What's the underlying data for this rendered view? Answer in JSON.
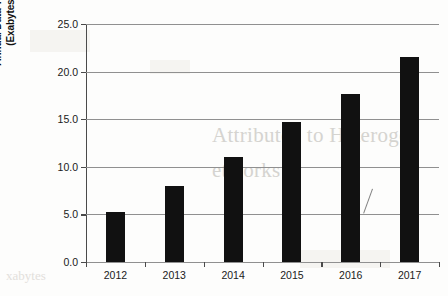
{
  "chart_data": {
    "type": "bar",
    "title": "",
    "subtitle": "",
    "xlabel": "",
    "ylabel": "Annual Data Traffic (Exabytes)",
    "ylabel_lines": [
      "Annual Data Traffic",
      "(Exabytes)"
    ],
    "categories": [
      "2012",
      "2013",
      "2014",
      "2015",
      "2016",
      "2017"
    ],
    "values": [
      5.3,
      8.0,
      11.0,
      14.7,
      17.7,
      21.5
    ],
    "ylim": [
      0.0,
      25.0
    ],
    "ytick_values": [
      0.0,
      5.0,
      10.0,
      15.0,
      20.0,
      25.0
    ],
    "ytick_labels": [
      "0.0",
      "5.0",
      "10.0",
      "15.0",
      "20.0",
      "25.0"
    ],
    "grid": true,
    "grid_axis": "y",
    "legend": false,
    "legend_position": "none",
    "bar_color": "#111111",
    "grid_color": "#909090",
    "axis_color": "#4a4a4a",
    "background_color": "#fdfdfc"
  },
  "artifacts": {
    "ghost_text_1": "Attributed to Heterogen",
    "ghost_text_2": "etworks",
    "ghost_text_3": "xabytes",
    "note": "faint scanned bleed-through text behind the chart"
  }
}
